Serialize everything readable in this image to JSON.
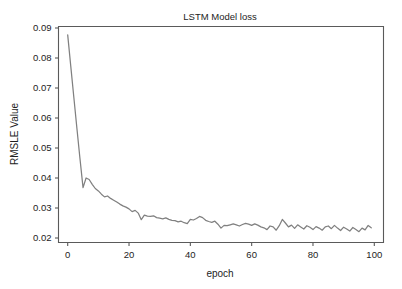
{
  "chart_data": {
    "type": "line",
    "title": "LSTM Model loss",
    "xlabel": "epoch",
    "ylabel": "RMSLE Value",
    "xlim": [
      -3,
      103
    ],
    "ylim": [
      0.0185,
      0.0905
    ],
    "xticks": [
      0,
      20,
      40,
      60,
      80,
      100
    ],
    "xtick_labels": [
      "0",
      "20",
      "40",
      "60",
      "80",
      "100"
    ],
    "yticks": [
      0.02,
      0.03,
      0.04,
      0.05,
      0.06,
      0.07,
      0.08,
      0.09
    ],
    "ytick_labels": [
      "0.02",
      "0.03",
      "0.04",
      "0.05",
      "0.06",
      "0.07",
      "0.08",
      "0.09"
    ],
    "grid": false,
    "legend": "none",
    "line_color": "#808080",
    "axis_color": "#5a5a5a",
    "series": [
      {
        "name": "train loss",
        "x": [
          0,
          1,
          2,
          3,
          4,
          5,
          6,
          7,
          8,
          9,
          10,
          11,
          12,
          13,
          14,
          15,
          16,
          17,
          18,
          19,
          20,
          21,
          22,
          23,
          24,
          25,
          26,
          27,
          28,
          29,
          30,
          31,
          32,
          33,
          34,
          35,
          36,
          37,
          38,
          39,
          40,
          41,
          42,
          43,
          44,
          45,
          46,
          47,
          48,
          49,
          50,
          51,
          52,
          53,
          54,
          55,
          56,
          57,
          58,
          59,
          60,
          61,
          62,
          63,
          64,
          65,
          66,
          67,
          68,
          69,
          70,
          71,
          72,
          73,
          74,
          75,
          76,
          77,
          78,
          79,
          80,
          81,
          82,
          83,
          84,
          85,
          86,
          87,
          88,
          89,
          90,
          91,
          92,
          93,
          94,
          95,
          96,
          97,
          98,
          99
        ],
        "values": [
          0.0877,
          0.0773,
          0.0669,
          0.0566,
          0.0465,
          0.0368,
          0.04,
          0.0395,
          0.0379,
          0.0365,
          0.0357,
          0.0346,
          0.0337,
          0.034,
          0.0332,
          0.0326,
          0.032,
          0.0313,
          0.0307,
          0.0303,
          0.0297,
          0.0288,
          0.0292,
          0.0283,
          0.0261,
          0.0276,
          0.0273,
          0.0272,
          0.0274,
          0.0268,
          0.0266,
          0.0264,
          0.0267,
          0.0262,
          0.0259,
          0.0258,
          0.0254,
          0.0256,
          0.0251,
          0.0248,
          0.0262,
          0.026,
          0.0265,
          0.0272,
          0.0268,
          0.0259,
          0.0255,
          0.0252,
          0.0256,
          0.0246,
          0.0233,
          0.0242,
          0.0241,
          0.0244,
          0.0247,
          0.0244,
          0.024,
          0.0245,
          0.0249,
          0.0246,
          0.0242,
          0.0247,
          0.0243,
          0.0237,
          0.0234,
          0.0228,
          0.024,
          0.0237,
          0.0226,
          0.0241,
          0.0262,
          0.025,
          0.0237,
          0.0243,
          0.0232,
          0.0244,
          0.0237,
          0.023,
          0.0241,
          0.0236,
          0.0228,
          0.0238,
          0.0233,
          0.0226,
          0.0237,
          0.024,
          0.0231,
          0.0242,
          0.0233,
          0.0225,
          0.0236,
          0.023,
          0.0223,
          0.0235,
          0.0228,
          0.0221,
          0.0233,
          0.0227,
          0.0242,
          0.0234
        ]
      }
    ]
  }
}
